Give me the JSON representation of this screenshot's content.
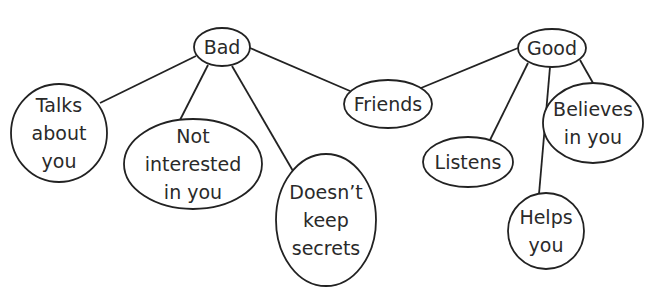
{
  "diagram": {
    "type": "concept-map",
    "colors": {
      "stroke": "#222222",
      "text": "#2a2a2a",
      "background": "#ffffff"
    },
    "nodes": [
      {
        "id": "friends",
        "lines": [
          "Friends"
        ],
        "cx": 388,
        "cy": 104,
        "rx": 44,
        "ry": 24
      },
      {
        "id": "bad",
        "lines": [
          "Bad"
        ],
        "cx": 222,
        "cy": 47,
        "rx": 28,
        "ry": 19
      },
      {
        "id": "good",
        "lines": [
          "Good"
        ],
        "cx": 552,
        "cy": 48,
        "rx": 34,
        "ry": 19
      },
      {
        "id": "talks-about-you",
        "lines": [
          "Talks",
          "about",
          "you"
        ],
        "cx": 59,
        "cy": 133,
        "rx": 48,
        "ry": 49
      },
      {
        "id": "not-interested-in-you",
        "lines": [
          "Not",
          "interested",
          "in you"
        ],
        "cx": 193,
        "cy": 164,
        "rx": 69,
        "ry": 45
      },
      {
        "id": "doesnt-keep-secrets",
        "lines": [
          "Doesn’t",
          "keep",
          "secrets"
        ],
        "cx": 326,
        "cy": 220,
        "rx": 50,
        "ry": 66
      },
      {
        "id": "listens",
        "lines": [
          "Listens"
        ],
        "cx": 468,
        "cy": 162,
        "rx": 45,
        "ry": 25
      },
      {
        "id": "helps-you",
        "lines": [
          "Helps",
          "you"
        ],
        "cx": 546,
        "cy": 231,
        "rx": 38,
        "ry": 38
      },
      {
        "id": "believes-in-you",
        "lines": [
          "Believes",
          "in you"
        ],
        "cx": 593,
        "cy": 123,
        "rx": 50,
        "ry": 40
      }
    ],
    "edges": [
      {
        "from": "bad",
        "to": "friends",
        "x1": 250,
        "y1": 48,
        "x2": 350,
        "y2": 91
      },
      {
        "from": "good",
        "to": "friends",
        "x1": 518,
        "y1": 48,
        "x2": 421,
        "y2": 88
      },
      {
        "from": "bad",
        "to": "talks-about-you",
        "x1": 196,
        "y1": 56,
        "x2": 100,
        "y2": 103
      },
      {
        "from": "bad",
        "to": "not-interested-in-you",
        "x1": 208,
        "y1": 65,
        "x2": 180,
        "y2": 120
      },
      {
        "from": "bad",
        "to": "doesnt-keep-secrets",
        "x1": 232,
        "y1": 66,
        "x2": 293,
        "y2": 171
      },
      {
        "from": "good",
        "to": "listens",
        "x1": 528,
        "y1": 63,
        "x2": 490,
        "y2": 140
      },
      {
        "from": "good",
        "to": "helps-you",
        "x1": 550,
        "y1": 67,
        "x2": 539,
        "y2": 194
      },
      {
        "from": "good",
        "to": "believes-in-you",
        "x1": 580,
        "y1": 60,
        "x2": 593,
        "y2": 83
      }
    ]
  }
}
